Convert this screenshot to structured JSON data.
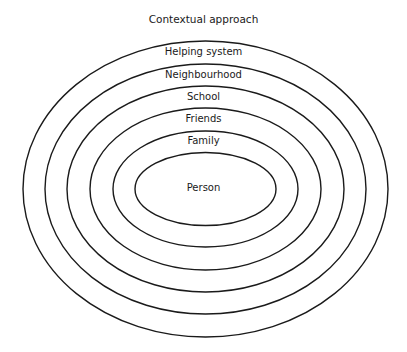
{
  "diagram": {
    "title": "Contextual approach",
    "type": "concentric-ellipses",
    "line_color": "#1a1a1a",
    "layers": [
      {
        "label": "Helping system",
        "rx": 182.5,
        "ry": 148,
        "label_y": 46
      },
      {
        "label": "Neighbourhood",
        "rx": 160.5,
        "ry": 125,
        "label_y": 69
      },
      {
        "label": "School",
        "rx": 138.5,
        "ry": 103,
        "label_y": 91
      },
      {
        "label": "Friends",
        "rx": 115.5,
        "ry": 81,
        "label_y": 113
      },
      {
        "label": "Family",
        "rx": 92.5,
        "ry": 58,
        "label_y": 135
      },
      {
        "label": "Person",
        "rx": 70.5,
        "ry": 36.5,
        "label_y": 182
      }
    ],
    "center": {
      "cx": 205.5,
      "cy": 189
    }
  }
}
